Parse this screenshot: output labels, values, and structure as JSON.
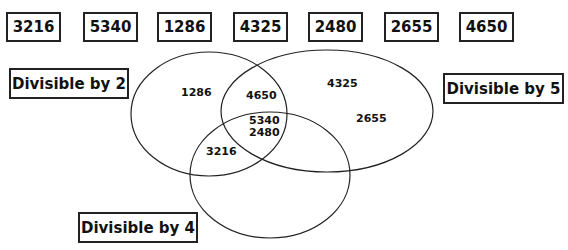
{
  "numbers": [
    "3216",
    "5340",
    "1286",
    "4325",
    "2480",
    "2655",
    "4650"
  ],
  "sets": {
    "div2": {
      "label": "Divisible by 2"
    },
    "div5": {
      "label": "Divisible by 5"
    },
    "div4": {
      "label": "Divisible by 4"
    }
  },
  "regions": {
    "div2_only": "1286",
    "div5_only_a": "4325",
    "div5_only_b": "2655",
    "div2_div5": "4650",
    "all_three_a": "5340",
    "all_three_b": "2480",
    "div2_div4": "3216"
  },
  "colors": {
    "stroke": "#222222",
    "background": "#ffffff"
  }
}
